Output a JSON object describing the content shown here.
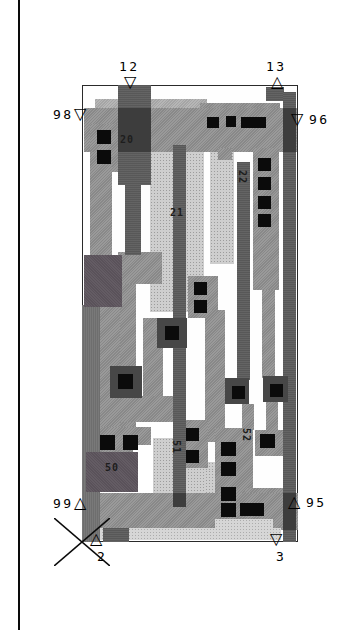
{
  "page": {
    "bg": "#ffffff",
    "rule_color": "#0a0a0a",
    "rule_x": 18
  },
  "cell": {
    "x": 82,
    "y": 85,
    "w": 216,
    "h": 457,
    "border_color": "#2a2a2a"
  },
  "palette": {
    "metal": "#919191",
    "metal_light": "#aeaeae",
    "diffusion": "#cecece",
    "diffusion_light": "#d6d6d6",
    "poly_dark": "#585858",
    "edge_dark": "#6e6e6e",
    "well_dark": "#5a525a",
    "overlap_dark": "#3d3d3d",
    "contact_frame": "#474747",
    "contact_cut": "#0b0b0b",
    "text": "#000000"
  },
  "symbols": {
    "down": "▽",
    "up": "△"
  },
  "pins": [
    {
      "id": "12",
      "text": "12",
      "marker": "down",
      "tx": 119,
      "ty": 60,
      "mx": 124,
      "my": 74
    },
    {
      "id": "13",
      "text": "13",
      "marker": "up",
      "tx": 266,
      "ty": 60,
      "mx": 271,
      "my": 74
    },
    {
      "id": "98",
      "text": "98",
      "marker": "down",
      "tx": 53,
      "ty": 108,
      "mx": 74,
      "my": 106
    },
    {
      "id": "96",
      "text": "96",
      "marker": "down",
      "tx": 309,
      "ty": 113,
      "mx": 291,
      "my": 111
    },
    {
      "id": "99",
      "text": "99",
      "marker": "up",
      "tx": 53,
      "ty": 497,
      "mx": 74,
      "my": 495
    },
    {
      "id": "95",
      "text": "95",
      "marker": "up",
      "tx": 306,
      "ty": 496,
      "mx": 288,
      "my": 494
    },
    {
      "id": "2",
      "text": "2",
      "marker": "up",
      "tx": 97,
      "ty": 550,
      "mx": 90,
      "my": 531
    },
    {
      "id": "3",
      "text": "3",
      "marker": "down",
      "tx": 276,
      "ty": 550,
      "mx": 270,
      "my": 531
    }
  ],
  "net_labels": [
    {
      "text": "20",
      "x": 120,
      "y": 134,
      "rot": false
    },
    {
      "text": "21",
      "x": 170,
      "y": 207,
      "rot": false
    },
    {
      "text": "22",
      "x": 248,
      "y": 170,
      "rot": true
    },
    {
      "text": "50",
      "x": 105,
      "y": 462,
      "rot": false
    },
    {
      "text": "51",
      "x": 182,
      "y": 440,
      "rot": true
    },
    {
      "text": "52",
      "x": 252,
      "y": 428,
      "rot": true
    }
  ],
  "x_mark": {
    "x": 54,
    "y": 518,
    "w": 56,
    "h": 48,
    "color": "#0a0a0a"
  },
  "layout_rects": [
    [
      "diff",
      150,
      150,
      54,
      162
    ],
    [
      "diff",
      210,
      152,
      24,
      112
    ],
    [
      "diff",
      153,
      438,
      22,
      56
    ],
    [
      "diff",
      184,
      462,
      32,
      58
    ],
    [
      "diff",
      205,
      470,
      12,
      50
    ],
    [
      "metal2",
      95,
      99,
      112,
      10
    ],
    [
      "metal",
      200,
      103,
      80,
      6
    ],
    [
      "metal",
      84,
      108,
      213,
      44
    ],
    [
      "metal",
      90,
      124,
      30,
      48
    ],
    [
      "metal",
      90,
      152,
      22,
      160
    ],
    [
      "metal",
      118,
      252,
      44,
      32
    ],
    [
      "metal",
      118,
      284,
      18,
      150
    ],
    [
      "metal",
      100,
      307,
      20,
      128
    ],
    [
      "metal",
      143,
      318,
      20,
      82
    ],
    [
      "metal",
      110,
      396,
      64,
      26
    ],
    [
      "metal",
      188,
      276,
      30,
      42
    ],
    [
      "metal",
      205,
      310,
      20,
      132
    ],
    [
      "metal",
      253,
      148,
      26,
      142
    ],
    [
      "metal",
      262,
      290,
      13,
      88
    ],
    [
      "metal",
      218,
      148,
      14,
      12
    ],
    [
      "metal",
      95,
      427,
      56,
      36
    ],
    [
      "metal",
      178,
      420,
      30,
      48
    ],
    [
      "metal",
      215,
      428,
      38,
      92
    ],
    [
      "metal",
      245,
      488,
      42,
      32
    ],
    [
      "metal",
      255,
      430,
      28,
      26
    ],
    [
      "metal",
      242,
      404,
      12,
      26
    ],
    [
      "metal",
      266,
      402,
      12,
      30
    ],
    [
      "metal",
      88,
      493,
      210,
      37
    ],
    [
      "bg",
      133,
      445,
      20,
      48
    ],
    [
      "diff2",
      95,
      528,
      186,
      12
    ],
    [
      "diff2",
      215,
      519,
      58,
      14
    ],
    [
      "poly",
      118,
      85,
      33,
      100
    ],
    [
      "poly",
      125,
      185,
      16,
      70
    ],
    [
      "poly",
      266,
      87,
      18,
      14
    ],
    [
      "poly",
      283,
      92,
      13,
      450
    ],
    [
      "poly",
      173,
      145,
      13,
      362
    ],
    [
      "poly",
      237,
      162,
      13,
      218
    ],
    [
      "edge",
      82,
      305,
      18,
      237
    ],
    [
      "poly",
      103,
      528,
      26,
      14
    ],
    [
      "well",
      84,
      255,
      38,
      52
    ],
    [
      "well",
      86,
      452,
      52,
      40
    ],
    [
      "xdark",
      118,
      108,
      33,
      44
    ],
    [
      "xdark",
      283,
      108,
      13,
      44
    ],
    [
      "xdark",
      283,
      493,
      13,
      37
    ],
    [
      "xdark",
      173,
      493,
      13,
      14
    ],
    [
      "csur",
      157,
      318,
      30,
      30
    ],
    [
      "csur",
      110,
      366,
      32,
      32
    ],
    [
      "csur",
      225,
      378,
      24,
      26
    ],
    [
      "csur",
      263,
      376,
      25,
      26
    ],
    [
      "cut",
      207,
      117,
      12,
      11
    ],
    [
      "cut",
      226,
      116,
      10,
      11
    ],
    [
      "cut",
      241,
      117,
      25,
      11
    ],
    [
      "cut",
      97,
      130,
      14,
      14
    ],
    [
      "cut",
      97,
      150,
      14,
      14
    ],
    [
      "cut",
      258,
      158,
      13,
      13
    ],
    [
      "cut",
      258,
      177,
      13,
      13
    ],
    [
      "cut",
      258,
      196,
      13,
      13
    ],
    [
      "cut",
      258,
      214,
      13,
      13
    ],
    [
      "cut",
      194,
      282,
      13,
      13
    ],
    [
      "cut",
      194,
      300,
      13,
      13
    ],
    [
      "cut",
      100,
      435,
      15,
      15
    ],
    [
      "cut",
      123,
      435,
      15,
      15
    ],
    [
      "cut",
      186,
      428,
      13,
      13
    ],
    [
      "cut",
      186,
      450,
      13,
      13
    ],
    [
      "cut",
      221,
      442,
      15,
      14
    ],
    [
      "cut",
      221,
      462,
      15,
      14
    ],
    [
      "cut",
      221,
      487,
      15,
      14
    ],
    [
      "cut",
      221,
      503,
      15,
      14
    ],
    [
      "cut",
      240,
      503,
      24,
      13
    ],
    [
      "cut",
      260,
      434,
      15,
      14
    ],
    [
      "cut",
      165,
      326,
      14,
      14
    ],
    [
      "cut",
      118,
      374,
      15,
      15
    ],
    [
      "cut",
      232,
      386,
      13,
      13
    ],
    [
      "cut",
      270,
      384,
      13,
      13
    ]
  ]
}
